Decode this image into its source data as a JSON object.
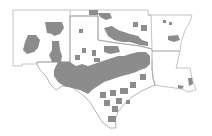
{
  "map": {
    "title": "",
    "area": "South-central United States",
    "states": [
      "New Mexico",
      "Oklahoma",
      "Texas",
      "Arkansas",
      "Louisiana"
    ],
    "colors": {
      "background": "#ffffff",
      "state_border": "#b4b4b4",
      "highlighted_county": "#8c8c8c"
    },
    "legend": null
  }
}
